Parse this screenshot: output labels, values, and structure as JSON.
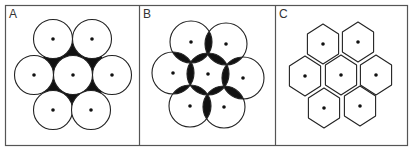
{
  "figure": {
    "colors": {
      "stroke": "#222222",
      "fill_dark": "#111111",
      "background": "#ffffff",
      "border": "#555555"
    },
    "panels": [
      {
        "label": "A",
        "description": "circles touching, interstitial spaces filled",
        "shape": "circle",
        "radius": 19.5,
        "centers": [
          [
            53,
            39
          ],
          [
            92,
            39
          ],
          [
            34,
            75
          ],
          [
            73,
            75
          ],
          [
            112,
            75
          ],
          [
            53,
            110
          ],
          [
            91,
            110
          ]
        ]
      },
      {
        "label": "B",
        "description": "circles overlapping, overlap regions filled",
        "shape": "circle",
        "radius": 21,
        "centers": [
          [
            191,
            42
          ],
          [
            226,
            44
          ],
          [
            173,
            73
          ],
          [
            208,
            74
          ],
          [
            243,
            78
          ],
          [
            190,
            106
          ],
          [
            224,
            107
          ]
        ]
      },
      {
        "label": "C",
        "description": "hexagonal tessellation",
        "shape": "hexagon",
        "radius": 20,
        "centers": [
          [
            323,
            44
          ],
          [
            358,
            42
          ],
          [
            305,
            76
          ],
          [
            341,
            75
          ],
          [
            376,
            75
          ],
          [
            324,
            108
          ],
          [
            360,
            106
          ]
        ]
      }
    ]
  }
}
